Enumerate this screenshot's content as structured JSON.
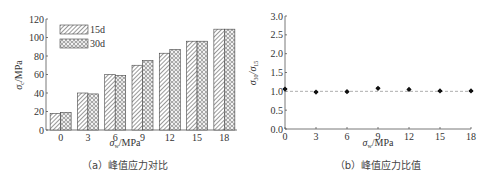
{
  "chart_data": [
    {
      "type": "bar",
      "title": "",
      "caption": "（a）峰值应力对比",
      "xlabel": "σ_w/MPa",
      "ylabel": "σ_c/MPa",
      "categories": [
        "0",
        "3",
        "6",
        "9",
        "12",
        "15",
        "18"
      ],
      "series": [
        {
          "name": "15d",
          "pattern": "diagonal-hatch",
          "values": [
            18,
            40,
            60,
            70,
            83,
            96,
            109
          ]
        },
        {
          "name": "30d",
          "pattern": "circle-grid",
          "values": [
            19,
            39,
            59,
            75,
            87,
            96,
            109
          ]
        }
      ],
      "ylim": [
        0,
        120
      ],
      "yticks": [
        "0",
        "20",
        "40",
        "60",
        "80",
        "100",
        "120"
      ],
      "legend_position": "upper-left",
      "grid": false
    },
    {
      "type": "scatter",
      "title": "",
      "caption": "（b）峰值应力比值",
      "xlabel": "σ_w/MPa",
      "ylabel": "σ_30/σ_15",
      "x": [
        0,
        3,
        6,
        9,
        12,
        15,
        18
      ],
      "series": [
        {
          "name": "ratio",
          "values": [
            1.06,
            0.98,
            0.99,
            1.08,
            1.05,
            1.01,
            1.01
          ]
        }
      ],
      "reference_line": {
        "y": 1.0,
        "style": "dashed"
      },
      "xlim": [
        0,
        18
      ],
      "ylim": [
        0,
        3.0
      ],
      "xticks": [
        "0",
        "3",
        "6",
        "9",
        "12",
        "15",
        "18"
      ],
      "yticks": [
        "0.0",
        "0.5",
        "1.0",
        "1.5",
        "2.0",
        "2.5",
        "3.0"
      ],
      "grid": false
    }
  ],
  "left": {
    "caption": "（a）峰值应力对比",
    "xlabel_sym": "σ",
    "xlabel_sub": "w",
    "xlabel_unit": "/MPa",
    "ylabel_sym": "σ",
    "ylabel_sub": "c",
    "ylabel_unit": "/MPa",
    "legend": [
      {
        "label": "15d"
      },
      {
        "label": "30d"
      }
    ]
  },
  "right": {
    "caption": "（b）峰值应力比值",
    "xlabel_sym": "σ",
    "xlabel_sub": "w",
    "xlabel_unit": "/MPa",
    "ylabel_num": "σ",
    "ylabel_num_sub": "30",
    "ylabel_den": "/σ",
    "ylabel_den_sub": "15"
  },
  "colors": {
    "axis": "#555555",
    "bar_stroke": "#444444",
    "marker": "#111111",
    "dashed": "#999999"
  }
}
